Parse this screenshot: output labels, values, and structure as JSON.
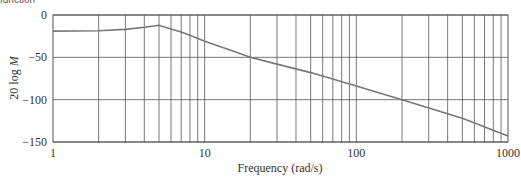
{
  "caption": "function",
  "chart_data": {
    "type": "line",
    "title": "",
    "xlabel": "Frequency (rad/s)",
    "ylabel": "20 log M",
    "xscale": "log",
    "xlim": [
      1,
      1000
    ],
    "ylim": [
      -150,
      0
    ],
    "xticks": [
      1,
      10,
      100,
      1000
    ],
    "xtick_labels": [
      "1",
      "10",
      "100",
      "1000"
    ],
    "yticks": [
      0,
      -50,
      -100,
      -150
    ],
    "ytick_labels": [
      "0",
      "−50",
      "−100",
      "−150"
    ],
    "grid": true,
    "legend": null,
    "series": [
      {
        "name": "magnitude",
        "color": "#777777",
        "x": [
          1,
          2,
          3,
          4,
          5,
          6,
          7,
          8,
          10,
          15,
          20,
          30,
          50,
          100,
          200,
          500,
          1000
        ],
        "y": [
          -19,
          -18.5,
          -17,
          -14.5,
          -12,
          -16.5,
          -20,
          -24,
          -31,
          -42,
          -50,
          -58,
          -68,
          -84,
          -100,
          -122,
          -143
        ]
      }
    ]
  }
}
